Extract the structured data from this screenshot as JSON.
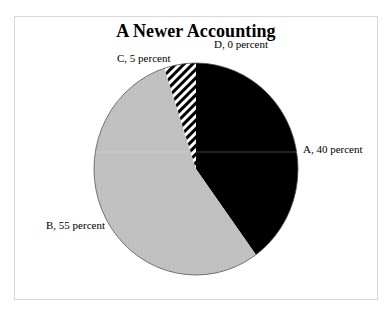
{
  "chart_data": {
    "type": "pie",
    "title": "A Newer Accounting",
    "categories": [
      "A",
      "B",
      "C",
      "D"
    ],
    "values": [
      40,
      55,
      5,
      0
    ],
    "unit": "percent",
    "start_angle_deg": 0,
    "direction": "clockwise",
    "labels": [
      "A, 40 percent",
      "B, 55 percent",
      "C, 5 percent",
      "D, 0 percent"
    ],
    "fills": {
      "A": "#000000",
      "B": "#c0c0c0",
      "C": "diagonal-hatch-black-white",
      "D": "none"
    },
    "legend": "none (data labels outside slices)"
  },
  "title": "A Newer Accounting",
  "slice_labels": {
    "a": "A, 40 percent",
    "b": "B, 55 percent",
    "c": "C, 5 percent",
    "d": "D, 0 percent"
  },
  "colors": {
    "a_fill": "#000000",
    "b_fill": "#c0c0c0",
    "border": "#d9d9d9"
  }
}
